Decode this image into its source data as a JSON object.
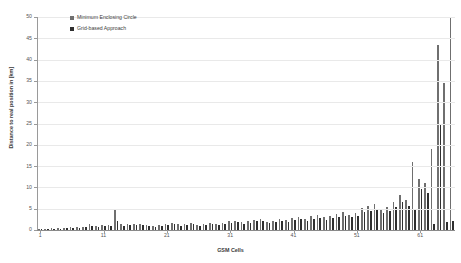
{
  "chart_data": {
    "type": "bar",
    "title": "",
    "xlabel": "GSM Cells",
    "ylabel": "Distance to real position in [km]",
    "ylim": [
      0,
      50
    ],
    "ytick_values": [
      0,
      5,
      10,
      15,
      20,
      25,
      30,
      35,
      40,
      45,
      50
    ],
    "xtick_values": [
      1,
      11,
      21,
      31,
      41,
      51,
      61
    ],
    "grid": true,
    "legend_position": "top-left",
    "colors": {
      "minimum_enclosing_circle": "#6f6f6f",
      "grid_based_approach": "#2f2f2f",
      "gridline": "#e9e9e9",
      "axis": "#9a9a9a",
      "background": "#ffffff"
    },
    "categories": [
      1,
      2,
      3,
      4,
      5,
      6,
      7,
      8,
      9,
      10,
      11,
      12,
      13,
      14,
      15,
      16,
      17,
      18,
      19,
      20,
      21,
      22,
      23,
      24,
      25,
      26,
      27,
      28,
      29,
      30,
      31,
      32,
      33,
      34,
      35,
      36,
      37,
      38,
      39,
      40,
      41,
      42,
      43,
      44,
      45,
      46,
      47,
      48,
      49,
      50,
      51,
      52,
      53,
      54,
      55,
      56,
      57,
      58,
      59,
      60,
      61,
      62,
      63,
      64,
      65,
      66
    ],
    "series": [
      {
        "name": "Minimum Enclosing Circle",
        "values": [
          0.3,
          0.3,
          0.4,
          0.4,
          0.5,
          0.6,
          0.7,
          0.8,
          1.3,
          0.9,
          1.1,
          1.2,
          5.0,
          1.3,
          1.4,
          1.5,
          1.4,
          1.1,
          1.0,
          1.2,
          1.5,
          1.6,
          1.3,
          1.5,
          1.7,
          1.2,
          1.4,
          1.6,
          1.5,
          1.7,
          2.0,
          2.2,
          1.8,
          2.0,
          2.4,
          2.6,
          1.9,
          2.2,
          2.5,
          2.3,
          2.8,
          3.0,
          2.6,
          3.2,
          3.5,
          3.0,
          3.4,
          3.8,
          4.2,
          3.6,
          4.0,
          5.2,
          5.6,
          6.2,
          5.0,
          5.4,
          6.6,
          8.2,
          7.0,
          16.0,
          12.0,
          11.0,
          19.0,
          43.5,
          34.5,
          50.0
        ]
      },
      {
        "name": "Grid-based Approach",
        "values": [
          0.2,
          0.2,
          0.3,
          0.3,
          0.4,
          0.5,
          0.5,
          0.6,
          1.0,
          0.7,
          0.9,
          1.0,
          2.2,
          1.0,
          1.1,
          1.2,
          1.1,
          0.9,
          0.8,
          1.0,
          1.2,
          1.3,
          1.0,
          1.2,
          1.4,
          1.0,
          1.1,
          1.3,
          1.2,
          1.4,
          1.6,
          1.8,
          1.5,
          1.6,
          2.0,
          2.1,
          1.6,
          1.8,
          2.0,
          1.9,
          2.3,
          2.5,
          2.1,
          2.6,
          2.9,
          2.4,
          2.8,
          3.1,
          3.4,
          3.0,
          3.3,
          4.2,
          4.5,
          5.0,
          4.1,
          4.4,
          5.4,
          6.6,
          5.6,
          5.0,
          9.6,
          8.8,
          1.5,
          25.0,
          1.8,
          2.0
        ]
      }
    ]
  },
  "legend": {
    "items": [
      {
        "label": "Minimum Enclosing Circle",
        "swatch": "sw-a"
      },
      {
        "label": "Grid-based Approach",
        "swatch": "sw-b"
      }
    ]
  }
}
